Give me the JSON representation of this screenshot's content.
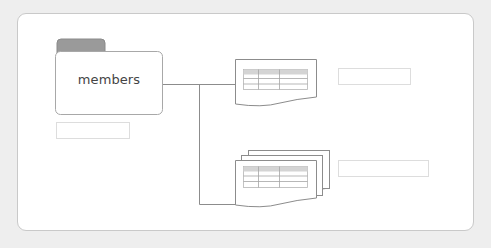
{
  "diagram": {
    "folder": {
      "label": "members",
      "icon": "folder-icon",
      "tab_color": "#999999",
      "border_color": "#aaaaaa"
    },
    "documents": [
      {
        "name": "single-table-document",
        "icon": "document-table-icon",
        "kind": "single"
      },
      {
        "name": "stacked-table-documents",
        "icon": "document-stack-icon",
        "kind": "stack"
      }
    ],
    "label_boxes": [
      {
        "name": "folder-caption-box",
        "text": ""
      },
      {
        "name": "single-document-caption-box",
        "text": ""
      },
      {
        "name": "document-stack-caption-box",
        "text": ""
      }
    ],
    "colors": {
      "background": "#eeeeee",
      "panel": "#ffffff",
      "line": "#888888",
      "table_header": "#d4d4d4"
    }
  }
}
